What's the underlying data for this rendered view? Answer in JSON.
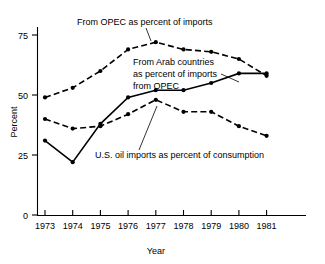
{
  "chart_data": {
    "type": "line",
    "title": "",
    "xlabel": "Year",
    "ylabel": "Percent",
    "categories": [
      "1973",
      "1974",
      "1975",
      "1976",
      "1977",
      "1978",
      "1979",
      "1980",
      "1981"
    ],
    "x": [
      1973,
      1974,
      1975,
      1976,
      1977,
      1978,
      1979,
      1980,
      1981
    ],
    "ylim": [
      0,
      80
    ],
    "yticks": [
      "0",
      "25",
      "50",
      "75"
    ],
    "ytick_values": [
      0,
      25,
      50,
      75
    ],
    "grid": false,
    "legend": "inline annotations",
    "series": [
      {
        "name": "From OPEC as percent of imports",
        "style": "dashed",
        "values": [
          49,
          53,
          60,
          69,
          72,
          69,
          68,
          65,
          58
        ]
      },
      {
        "name": "From Arab countries as percent of imports from OPEC",
        "style": "solid",
        "values": [
          31,
          22,
          38,
          49,
          52,
          52,
          55,
          59,
          59
        ]
      },
      {
        "name": "U.S. oil imports as percent of consumption",
        "style": "dashed",
        "values": [
          40,
          36,
          37,
          42,
          48,
          43,
          43,
          37,
          33
        ]
      }
    ],
    "annotations": [
      {
        "id": "opec-imports-label",
        "text": "From OPEC as percent of imports"
      },
      {
        "id": "arab-countries-label",
        "line1": "From Arab countries",
        "line2": "as percent of imports",
        "line3": "from OPEC"
      },
      {
        "id": "us-imports-label",
        "text": "U.S. oil imports as percent of consumption"
      }
    ]
  },
  "axes": {
    "y_title": "Percent",
    "x_title": "Year",
    "y_tick_labels": [
      "75",
      "50",
      "25",
      "0"
    ],
    "x_tick_labels": [
      "1973",
      "1974",
      "1975",
      "1976",
      "1977",
      "1978",
      "1979",
      "1980",
      "1981"
    ]
  },
  "colors": {
    "ink": "#000000",
    "background": "#ffffff"
  }
}
